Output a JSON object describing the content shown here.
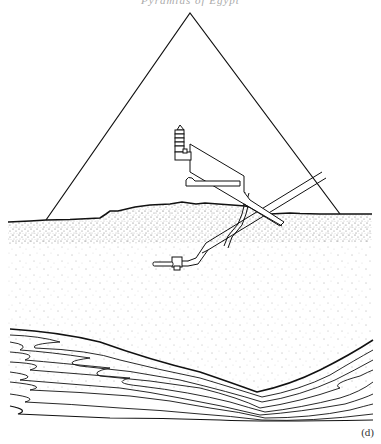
{
  "header": {
    "text": "Pyramids of Egypt"
  },
  "figure": {
    "panel_label": "(d)",
    "elements": [
      {
        "name": "pyramid-outline",
        "apex": [
          190,
          13
        ],
        "base_left": [
          46,
          220
        ],
        "base_right": [
          340,
          214
        ]
      },
      {
        "name": "kings-chamber-with-relieving-chambers",
        "position": [
          175,
          135
        ]
      },
      {
        "name": "grand-gallery",
        "from": [
          190,
          172
        ],
        "to": [
          245,
          205
        ]
      },
      {
        "name": "queens-chamber",
        "position": [
          190,
          188
        ]
      },
      {
        "name": "ascending-passage"
      },
      {
        "name": "descending-passage",
        "entrance": [
          322,
          180
        ]
      },
      {
        "name": "well-shaft"
      },
      {
        "name": "subterranean-chamber",
        "position": [
          155,
          262
        ]
      },
      {
        "name": "bedrock-plateau-surface"
      },
      {
        "name": "rock-strata-layers"
      }
    ]
  },
  "colors": {
    "ink": "#111111",
    "paper": "#ffffff",
    "stipple": "#555555"
  }
}
